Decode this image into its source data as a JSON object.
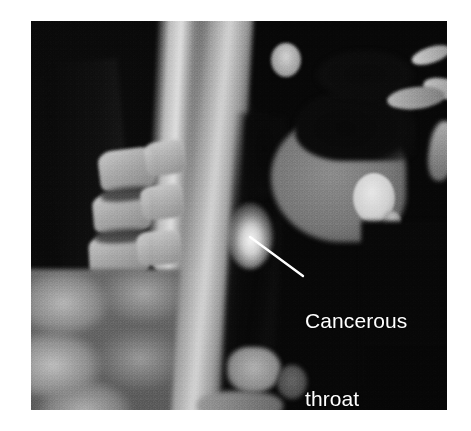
{
  "figure": {
    "name": "sagittal-head-neck-scan",
    "modality_appearance": "grayscale sagittal cross-sectional scan of head and neck",
    "background_color": "#ffffff",
    "image_frame_color": "#060606"
  },
  "annotation": {
    "label_lines": [
      "Cancerous",
      "throat",
      "tissue"
    ],
    "line1": "Cancerous",
    "line2": "throat",
    "line3": "tissue",
    "text_color": "#ffffff",
    "leader_line_color": "#ffffff",
    "leader_from": {
      "x": 250,
      "y": 237
    },
    "leader_to": {
      "x": 303,
      "y": 276
    },
    "points_to": "bright hyperintense focus in posterior pharyngeal wall"
  },
  "anatomy": {
    "regions": [
      {
        "name": "occipital-air-space",
        "tone": "black"
      },
      {
        "name": "skull-base-bright-band",
        "tone": "bright"
      },
      {
        "name": "cervical-vertebrae",
        "tone": "bright-blocks"
      },
      {
        "name": "intervertebral-discs",
        "tone": "dark-gray"
      },
      {
        "name": "posterior-neck-muscle",
        "tone": "mid-gray-mottled"
      },
      {
        "name": "prevertebral-soft-tissue-band",
        "tone": "bright"
      },
      {
        "name": "pharyngeal-airway",
        "tone": "black-column"
      },
      {
        "name": "tongue-oral-soft-tissue",
        "tone": "mid-gray"
      },
      {
        "name": "oral-air-space",
        "tone": "black"
      },
      {
        "name": "mandible-bone",
        "tone": "very-bright-oval"
      },
      {
        "name": "nasal-sinus-bone",
        "tone": "bright-slivers"
      },
      {
        "name": "larynx-structures",
        "tone": "gray"
      },
      {
        "name": "cancerous-lesion",
        "tone": "hyperintense-white"
      }
    ],
    "vertebrae": [
      {
        "left": 68,
        "top": 128,
        "width": 56,
        "height": 42,
        "rot": -7
      },
      {
        "left": 62,
        "top": 172,
        "width": 58,
        "height": 40,
        "rot": -5
      },
      {
        "left": 58,
        "top": 214,
        "width": 60,
        "height": 42,
        "rot": -3
      },
      {
        "left": 54,
        "top": 258,
        "width": 62,
        "height": 44,
        "rot": -1
      },
      {
        "left": 50,
        "top": 304,
        "width": 64,
        "height": 44,
        "rot": 1
      },
      {
        "left": 48,
        "top": 350,
        "width": 66,
        "height": 44,
        "rot": 2
      }
    ],
    "discs": [
      {
        "left": 70,
        "top": 166,
        "width": 52,
        "height": 14,
        "rot": -6
      },
      {
        "left": 64,
        "top": 208,
        "width": 54,
        "height": 14,
        "rot": -4
      },
      {
        "left": 60,
        "top": 252,
        "width": 56,
        "height": 14,
        "rot": -2
      },
      {
        "left": 56,
        "top": 298,
        "width": 58,
        "height": 14,
        "rot": 0
      },
      {
        "left": 52,
        "top": 344,
        "width": 60,
        "height": 14,
        "rot": 2
      }
    ],
    "posterior_elements": [
      {
        "left": 114,
        "top": 120,
        "width": 40,
        "height": 34,
        "rot": -8
      },
      {
        "left": 110,
        "top": 164,
        "width": 42,
        "height": 34,
        "rot": -6
      },
      {
        "left": 106,
        "top": 210,
        "width": 44,
        "height": 34,
        "rot": -4
      },
      {
        "left": 102,
        "top": 256,
        "width": 46,
        "height": 34,
        "rot": -2
      },
      {
        "left": 100,
        "top": 304,
        "width": 46,
        "height": 34,
        "rot": 0
      }
    ]
  }
}
